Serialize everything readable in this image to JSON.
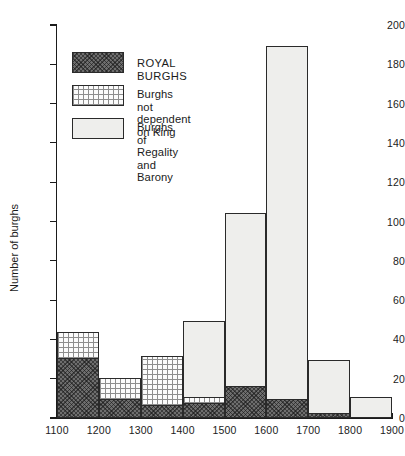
{
  "chart_data": {
    "type": "bar",
    "subtype": "stacked-histogram",
    "title": "",
    "xlabel": "",
    "ylabel": "Number of burghs",
    "ylim": [
      0,
      200
    ],
    "ytick_step": 20,
    "yticks": [
      0,
      20,
      40,
      60,
      80,
      100,
      120,
      140,
      160,
      180,
      200
    ],
    "xticks": [
      1100,
      1200,
      1300,
      1400,
      1500,
      1600,
      1700,
      1800,
      1900
    ],
    "xlim": [
      1100,
      1900
    ],
    "bin_width": 100,
    "grid": false,
    "legend_position": "upper-left",
    "bin_starts": [
      1100,
      1200,
      1300,
      1400,
      1500,
      1600,
      1700,
      1800
    ],
    "bin_labels": [
      "1100-1200",
      "1200-1300",
      "1300-1400",
      "1400-1500",
      "1500-1600",
      "1600-1700",
      "1700-1800",
      "1800-1900"
    ],
    "series": [
      {
        "name": "ROYAL BURGHS",
        "key": "royal",
        "fill": "dark-crosshatch",
        "color": "#6e6e6e",
        "values": [
          30,
          9,
          6,
          7,
          16,
          9,
          2,
          0
        ]
      },
      {
        "name": "Burghs not dependent on King",
        "key": "not_dependent",
        "fill": "grid",
        "color": "#fbfbfb",
        "values": [
          13,
          11,
          25,
          3,
          0,
          0,
          0,
          0
        ]
      },
      {
        "name": "Burghs of Regality and Barony",
        "key": "regality_barony",
        "fill": "light",
        "color": "#eeeeec",
        "values": [
          0,
          0,
          0,
          39,
          88,
          180,
          27,
          10
        ]
      }
    ],
    "totals": [
      43,
      20,
      31,
      49,
      104,
      189,
      29,
      10
    ]
  },
  "legend": {
    "entries": [
      {
        "label": "ROYAL BURGHS",
        "swatch": "dark-crosshatch"
      },
      {
        "label": "Burghs not\ndependent on King",
        "swatch": "grid"
      },
      {
        "label": "Burghs of Regality\nand Barony",
        "swatch": "light"
      }
    ]
  },
  "axes": {
    "y_title": "Number of burghs"
  }
}
